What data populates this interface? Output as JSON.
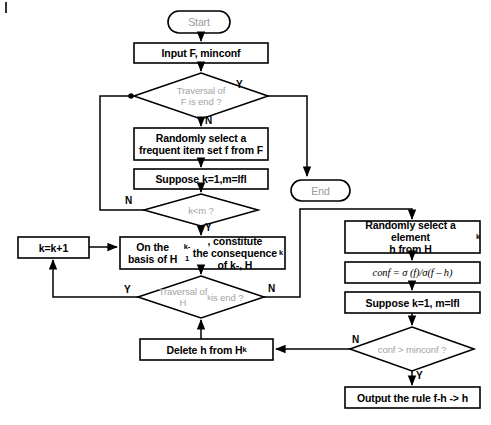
{
  "diagram": {
    "nodes": {
      "start": {
        "label": "Start",
        "shape": "terminator"
      },
      "input": {
        "label": "Input F, minconf",
        "shape": "process"
      },
      "traversal_f": {
        "label": "Traversal of\nF is end ?",
        "shape": "decision"
      },
      "select_f": {
        "label": "Randomly select a\nfrequent item set f from F",
        "shape": "process"
      },
      "suppose_left": {
        "label": "Suppose k=1,m=lfl",
        "shape": "process"
      },
      "k_lt_m": {
        "label": "k<m ?",
        "shape": "decision"
      },
      "constitute": {
        "label": "On the basis of Hk-1, constitute\nthe consequence of k-, Hk",
        "shape": "process"
      },
      "traversal_hk": {
        "label": "Traversal of\nHk is end ?",
        "shape": "decision"
      },
      "k_increment": {
        "label": "k=k+1",
        "shape": "process"
      },
      "delete_h": {
        "label": "Delete h from Hk",
        "shape": "process"
      },
      "end": {
        "label": "End",
        "shape": "terminator"
      },
      "select_h": {
        "label": "Randomly select a element\nh from Hk",
        "shape": "process"
      },
      "conf_formula": {
        "label": "conf = σ (f)/σ(f – h)",
        "shape": "process"
      },
      "suppose_right": {
        "label": "Suppose k=1, m=lfl",
        "shape": "process"
      },
      "conf_gt_minconf": {
        "label": "conf > minconf ?",
        "shape": "decision"
      },
      "output_rule": {
        "label": "Output the rule f-h -> h",
        "shape": "process"
      }
    },
    "edge_labels": {
      "traversal_f_yes": "Y",
      "traversal_f_no": "N",
      "k_lt_m_no": "N",
      "k_lt_m_yes": "Y",
      "traversal_hk_yes": "Y",
      "traversal_hk_no": "N",
      "conf_no": "N",
      "conf_yes": "Y"
    },
    "colors": {
      "stroke": "#000000",
      "fill": "#ffffff",
      "text": "#000000",
      "muted_text": "#9a9a9a"
    }
  }
}
